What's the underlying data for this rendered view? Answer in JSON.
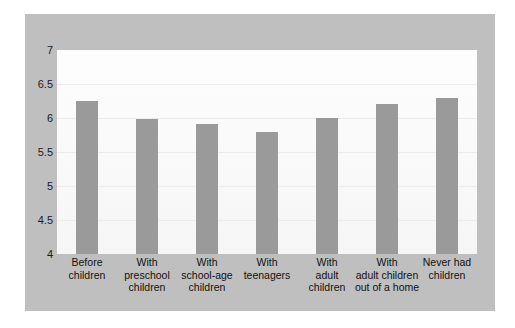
{
  "chart_data": {
    "type": "bar",
    "title": "",
    "subtitle": "",
    "xlabel": "",
    "ylabel": "",
    "ylim": [
      4,
      7
    ],
    "ytick_labels": [
      "7",
      "6.5",
      "6",
      "5.5",
      "5",
      "4.5",
      "4"
    ],
    "ytick_values": [
      7,
      6.5,
      6,
      5.5,
      5,
      4.5,
      4
    ],
    "grid": true,
    "legend": "none",
    "bar_color": "#9a9a9a",
    "plot_background": "#fbfbfb",
    "panel_background": "#bfbfbf",
    "figure_background": "#ffffff",
    "categories": [
      "Before children",
      "With preschool children",
      "With school-age children",
      "With teenagers",
      "With adult children",
      "With adult children out of a home",
      "Never had children"
    ],
    "category_lines": [
      [
        "Before",
        "children"
      ],
      [
        "With",
        "preschool",
        "children"
      ],
      [
        "With",
        "school-age",
        "children"
      ],
      [
        "With",
        "teenagers"
      ],
      [
        "With",
        "adult",
        "children"
      ],
      [
        "With",
        "adult children",
        "out of a home"
      ],
      [
        "Never had",
        "children"
      ]
    ],
    "values": [
      6.25,
      5.98,
      5.91,
      5.8,
      6.0,
      6.2,
      6.3
    ]
  }
}
